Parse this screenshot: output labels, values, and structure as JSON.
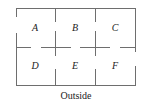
{
  "diagram": {
    "type": "floor-plan",
    "caption": "Outside",
    "grid": {
      "rows": 2,
      "cols": 3
    },
    "rooms": [
      {
        "id": "A",
        "label": "A",
        "row": 0,
        "col": 0
      },
      {
        "id": "B",
        "label": "B",
        "row": 0,
        "col": 1
      },
      {
        "id": "C",
        "label": "C",
        "row": 0,
        "col": 2
      },
      {
        "id": "D",
        "label": "D",
        "row": 1,
        "col": 0
      },
      {
        "id": "E",
        "label": "E",
        "row": 1,
        "col": 1
      },
      {
        "id": "F",
        "label": "F",
        "row": 1,
        "col": 2
      }
    ],
    "doors": [
      {
        "between": [
          "A",
          "Outside"
        ],
        "wall": "left"
      },
      {
        "between": [
          "C",
          "F"
        ],
        "wall": "right-exterior-gap",
        "note": "gap in right outer wall near F"
      },
      {
        "between": [
          "A",
          "B"
        ],
        "wall": "vertical"
      },
      {
        "between": [
          "B",
          "C"
        ],
        "wall": "vertical"
      },
      {
        "between": [
          "D",
          "E"
        ],
        "wall": "vertical"
      },
      {
        "between": [
          "E",
          "F"
        ],
        "wall": "vertical"
      },
      {
        "between": [
          "A",
          "D"
        ],
        "wall": "horizontal"
      },
      {
        "between": [
          "B",
          "E"
        ],
        "wall": "horizontal"
      },
      {
        "between": [
          "C",
          "F"
        ],
        "wall": "horizontal"
      }
    ],
    "colors": {
      "wall": "#6e6e6e",
      "text": "#222222",
      "background": "#ffffff"
    }
  }
}
